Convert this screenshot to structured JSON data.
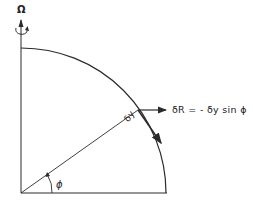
{
  "labels": {
    "rotation": "Ω",
    "equation": "δR = - δy sin ϕ",
    "displacement": "δy",
    "angle": "ϕ"
  },
  "colors": {
    "stroke": "#2a2a2a",
    "background": "#ffffff"
  }
}
